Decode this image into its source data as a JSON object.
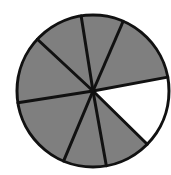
{
  "diagram": {
    "type": "fraction-circle",
    "total_parts": 8,
    "shaded_parts": 7,
    "unshaded_parts": 1,
    "shaded_color": "#7f7f7f",
    "unshaded_color": "#ffffff",
    "line_color": "#111111"
  },
  "geometry": {
    "cx": 93,
    "cy": 91,
    "r": 76,
    "spokes": [
      [
        81,
        15
      ],
      [
        122,
        24
      ],
      [
        163,
        78
      ],
      [
        145,
        142
      ],
      [
        106,
        164
      ],
      [
        64,
        160
      ],
      [
        17,
        103
      ],
      [
        36,
        38
      ]
    ],
    "unshaded_slice_index": 2
  }
}
